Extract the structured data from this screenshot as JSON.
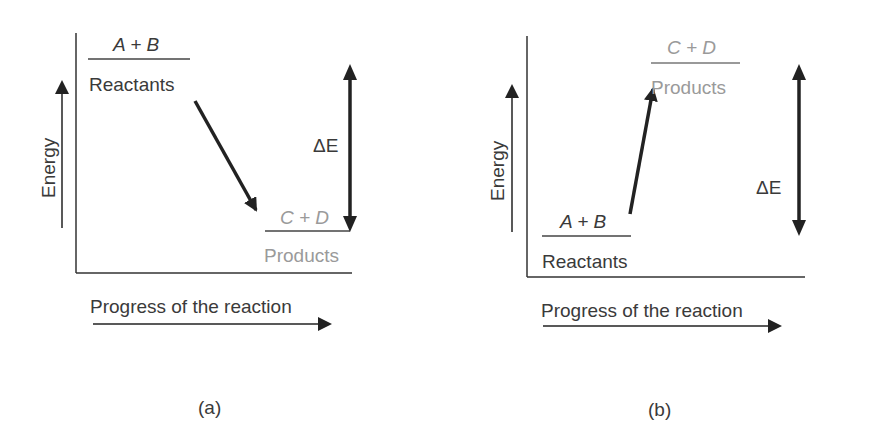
{
  "panels": [
    {
      "id": "a",
      "caption": "(a)",
      "y_axis_label": "Energy",
      "x_axis_label": "Progress of the reaction",
      "reactants": {
        "formula": "A + B",
        "label": "Reactants"
      },
      "products": {
        "formula": "C + D",
        "label": "Products"
      },
      "delta_label": "ΔE",
      "direction": "exothermic"
    },
    {
      "id": "b",
      "caption": "(b)",
      "y_axis_label": "Energy",
      "x_axis_label": "Progress of the reaction",
      "reactants": {
        "formula": "A + B",
        "label": "Reactants"
      },
      "products": {
        "formula": "C + D",
        "label": "Products"
      },
      "delta_label": "ΔE",
      "direction": "endothermic"
    }
  ],
  "colors": {
    "dark": "#3a3a3a",
    "grey": "#9a9a9a",
    "line": "#333333"
  }
}
